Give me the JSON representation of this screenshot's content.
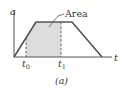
{
  "figure": {
    "caption": "(a)",
    "y_axis_label": "a",
    "x_axis_label": "t",
    "area_label": "Area",
    "tick_labels": [
      {
        "main": "t",
        "sub": "0"
      },
      {
        "main": "t",
        "sub": "1"
      }
    ],
    "colors": {
      "curve": "#555555",
      "shade": "#dcdcdc",
      "axis": "#555555",
      "dash": "#555555",
      "text": "#3a3a3a"
    }
  }
}
